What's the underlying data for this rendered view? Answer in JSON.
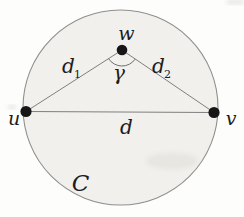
{
  "figure": {
    "circle_label": "C",
    "points": {
      "u": "u",
      "v": "v",
      "w": "w"
    },
    "edges": {
      "chord": "d",
      "d1_base": "d",
      "d1_sub": "1",
      "d2_base": "d",
      "d2_sub": "2"
    },
    "angle_label": "γ"
  },
  "colors": {
    "background": "#fdfdfc",
    "circle_fill": "#f2f1ee",
    "circle_stroke": "#8f8f8f",
    "line": "#7f7f7f",
    "dot": "#161616",
    "text": "#1c1c1c"
  }
}
